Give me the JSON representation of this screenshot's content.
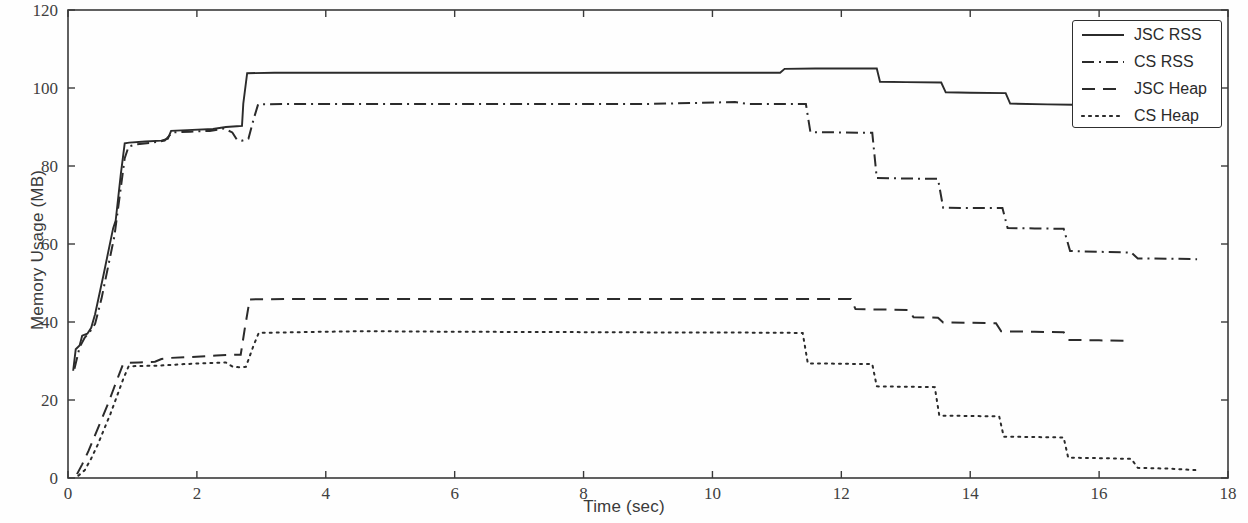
{
  "chart_data": {
    "type": "line",
    "title": "",
    "xlabel": "Time (sec)",
    "ylabel": "Memory Usage (MB)",
    "xlim": [
      0,
      18
    ],
    "ylim": [
      0,
      120
    ],
    "xticks": [
      0,
      2,
      4,
      6,
      8,
      10,
      12,
      14,
      16,
      18
    ],
    "yticks": [
      0,
      20,
      40,
      60,
      80,
      100,
      120
    ],
    "grid": false,
    "legend_position": "top-right",
    "line_color": "#2b2b2b",
    "series": [
      {
        "name": "JSC RSS",
        "style": "solid",
        "points": [
          [
            0.08,
            27.5
          ],
          [
            0.12,
            33.0
          ],
          [
            0.18,
            34.0
          ],
          [
            0.22,
            36.5
          ],
          [
            0.3,
            37.0
          ],
          [
            0.36,
            38.5
          ],
          [
            0.42,
            42.0
          ],
          [
            0.55,
            52.0
          ],
          [
            0.7,
            64.0
          ],
          [
            0.74,
            66.0
          ],
          [
            0.82,
            78.0
          ],
          [
            0.88,
            85.8
          ],
          [
            0.95,
            86.0
          ],
          [
            1.2,
            86.3
          ],
          [
            1.45,
            86.5
          ],
          [
            1.55,
            87.0
          ],
          [
            1.6,
            89.0
          ],
          [
            1.85,
            89.2
          ],
          [
            2.25,
            89.5
          ],
          [
            2.45,
            90.0
          ],
          [
            2.62,
            90.2
          ],
          [
            2.7,
            90.3
          ],
          [
            2.72,
            96.0
          ],
          [
            2.78,
            103.8
          ],
          [
            3.2,
            103.9
          ],
          [
            6.0,
            103.9
          ],
          [
            9.0,
            103.9
          ],
          [
            11.05,
            103.9
          ],
          [
            11.12,
            104.9
          ],
          [
            11.6,
            105.0
          ],
          [
            12.4,
            105.0
          ],
          [
            12.55,
            105.0
          ],
          [
            12.6,
            101.6
          ],
          [
            13.0,
            101.5
          ],
          [
            13.55,
            101.4
          ],
          [
            13.62,
            98.9
          ],
          [
            14.0,
            98.8
          ],
          [
            14.55,
            98.7
          ],
          [
            14.62,
            96.0
          ],
          [
            15.2,
            95.8
          ],
          [
            15.6,
            95.7
          ],
          [
            15.68,
            95.0
          ],
          [
            16.4,
            94.9
          ],
          [
            17.5,
            94.8
          ],
          [
            17.55,
            94.8
          ]
        ]
      },
      {
        "name": "CS RSS",
        "style": "dashdot",
        "points": [
          [
            0.1,
            28.0
          ],
          [
            0.18,
            33.5
          ],
          [
            0.26,
            36.0
          ],
          [
            0.34,
            37.5
          ],
          [
            0.42,
            39.5
          ],
          [
            0.52,
            46.0
          ],
          [
            0.62,
            54.0
          ],
          [
            0.72,
            62.0
          ],
          [
            0.8,
            72.0
          ],
          [
            0.88,
            82.0
          ],
          [
            0.94,
            85.0
          ],
          [
            1.05,
            85.5
          ],
          [
            1.3,
            86.0
          ],
          [
            1.5,
            86.5
          ],
          [
            1.62,
            88.6
          ],
          [
            1.9,
            88.8
          ],
          [
            2.2,
            89.0
          ],
          [
            2.42,
            89.6
          ],
          [
            2.55,
            88.6
          ],
          [
            2.62,
            86.8
          ],
          [
            2.7,
            86.5
          ],
          [
            2.8,
            87.0
          ],
          [
            2.88,
            92.0
          ],
          [
            2.95,
            95.8
          ],
          [
            3.5,
            95.9
          ],
          [
            6.0,
            95.9
          ],
          [
            9.0,
            95.9
          ],
          [
            10.35,
            96.4
          ],
          [
            10.55,
            95.9
          ],
          [
            11.45,
            95.9
          ],
          [
            11.52,
            88.7
          ],
          [
            12.0,
            88.6
          ],
          [
            12.48,
            88.5
          ],
          [
            12.55,
            76.9
          ],
          [
            13.0,
            76.8
          ],
          [
            13.5,
            76.7
          ],
          [
            13.58,
            69.3
          ],
          [
            14.0,
            69.2
          ],
          [
            14.5,
            69.2
          ],
          [
            14.58,
            64.1
          ],
          [
            15.0,
            64.0
          ],
          [
            15.45,
            63.9
          ],
          [
            15.55,
            58.2
          ],
          [
            16.0,
            58.0
          ],
          [
            16.5,
            57.8
          ],
          [
            16.6,
            56.3
          ],
          [
            17.2,
            56.2
          ],
          [
            17.52,
            56.1
          ]
        ]
      },
      {
        "name": "JSC Heap",
        "style": "dashed",
        "points": [
          [
            0.14,
            1.0
          ],
          [
            0.22,
            3.5
          ],
          [
            0.32,
            7.0
          ],
          [
            0.42,
            11.0
          ],
          [
            0.52,
            15.0
          ],
          [
            0.62,
            19.0
          ],
          [
            0.7,
            22.5
          ],
          [
            0.78,
            26.0
          ],
          [
            0.85,
            29.0
          ],
          [
            0.92,
            29.5
          ],
          [
            1.1,
            29.6
          ],
          [
            1.35,
            29.8
          ],
          [
            1.45,
            30.5
          ],
          [
            1.6,
            30.8
          ],
          [
            1.9,
            31.0
          ],
          [
            2.3,
            31.4
          ],
          [
            2.58,
            31.6
          ],
          [
            2.68,
            31.6
          ],
          [
            2.74,
            38.0
          ],
          [
            2.82,
            45.8
          ],
          [
            3.4,
            45.9
          ],
          [
            6.0,
            45.9
          ],
          [
            9.0,
            45.9
          ],
          [
            11.0,
            45.9
          ],
          [
            12.05,
            45.9
          ],
          [
            12.15,
            45.9
          ],
          [
            12.22,
            43.3
          ],
          [
            12.6,
            43.2
          ],
          [
            13.05,
            43.1
          ],
          [
            13.12,
            41.2
          ],
          [
            13.5,
            41.1
          ],
          [
            13.58,
            39.9
          ],
          [
            14.0,
            39.8
          ],
          [
            14.4,
            39.7
          ],
          [
            14.48,
            37.6
          ],
          [
            15.0,
            37.5
          ],
          [
            15.45,
            37.4
          ],
          [
            15.52,
            35.4
          ],
          [
            16.0,
            35.3
          ],
          [
            16.45,
            35.2
          ]
        ]
      },
      {
        "name": "CS Heap",
        "style": "dotted",
        "points": [
          [
            0.16,
            0.6
          ],
          [
            0.26,
            2.0
          ],
          [
            0.36,
            5.0
          ],
          [
            0.46,
            8.5
          ],
          [
            0.56,
            12.5
          ],
          [
            0.66,
            16.5
          ],
          [
            0.76,
            21.0
          ],
          [
            0.86,
            25.5
          ],
          [
            0.94,
            28.6
          ],
          [
            1.05,
            28.7
          ],
          [
            1.4,
            28.8
          ],
          [
            1.8,
            29.2
          ],
          [
            2.2,
            29.5
          ],
          [
            2.45,
            29.6
          ],
          [
            2.55,
            28.6
          ],
          [
            2.65,
            28.4
          ],
          [
            2.76,
            28.5
          ],
          [
            2.88,
            34.0
          ],
          [
            2.96,
            37.2
          ],
          [
            3.6,
            37.4
          ],
          [
            4.4,
            37.6
          ],
          [
            5.0,
            37.6
          ],
          [
            6.0,
            37.5
          ],
          [
            8.0,
            37.4
          ],
          [
            9.6,
            37.3
          ],
          [
            10.3,
            37.3
          ],
          [
            11.4,
            37.2
          ],
          [
            11.48,
            29.4
          ],
          [
            12.0,
            29.3
          ],
          [
            12.48,
            29.2
          ],
          [
            12.55,
            23.5
          ],
          [
            13.0,
            23.4
          ],
          [
            13.45,
            23.3
          ],
          [
            13.52,
            16.0
          ],
          [
            14.0,
            15.9
          ],
          [
            14.45,
            15.8
          ],
          [
            14.52,
            10.6
          ],
          [
            15.0,
            10.5
          ],
          [
            15.45,
            10.4
          ],
          [
            15.52,
            5.2
          ],
          [
            16.0,
            5.1
          ],
          [
            16.5,
            4.9
          ],
          [
            16.6,
            2.6
          ],
          [
            17.1,
            2.4
          ],
          [
            17.52,
            2.0
          ]
        ]
      }
    ]
  },
  "legend": {
    "entries": [
      {
        "label": "JSC RSS",
        "style": "solid"
      },
      {
        "label": "CS RSS",
        "style": "dashdot"
      },
      {
        "label": "JSC Heap",
        "style": "dashed"
      },
      {
        "label": "CS Heap",
        "style": "dotted"
      }
    ]
  }
}
